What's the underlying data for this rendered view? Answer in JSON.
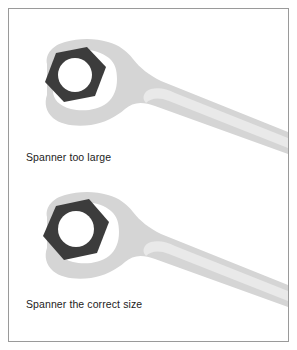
{
  "panel": {
    "background_color": "#ffffff",
    "border_color": "#9a9a9a"
  },
  "palette": {
    "spanner_body": "#d5d5d5",
    "spanner_highlight": "#e9e9e9",
    "nut_fill": "#3c3c3c",
    "nut_hole": "#ffffff",
    "jaw_opening": "#ffffff",
    "caption_text": "#1c1c1c"
  },
  "figures": [
    {
      "id": "spanner-too-large",
      "caption": "Spanner too large",
      "nut_label": "hex-nut",
      "fit": "loose",
      "jaw_gap_visible": true
    },
    {
      "id": "spanner-correct-size",
      "caption": "Spanner the correct size",
      "nut_label": "hex-nut",
      "fit": "snug",
      "jaw_gap_visible": false
    }
  ]
}
